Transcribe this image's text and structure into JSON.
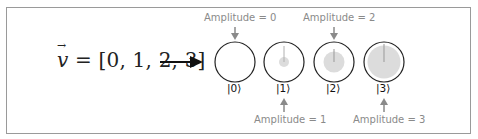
{
  "equation": {
    "lhs": "v",
    "rhs": " = [0, 1, 2, 3]"
  },
  "colors": {
    "arrow": "#111111",
    "label_gray": "#8a8a8a",
    "fill_gray": "#dcdcdc",
    "circle_stroke": "#222222"
  },
  "states": [
    {
      "ket": "|0⟩",
      "amplitude_label": "Amplitude = 0",
      "amplitude": 0,
      "label_position": "top"
    },
    {
      "ket": "|1⟩",
      "amplitude_label": "Amplitude = 1",
      "amplitude": 1,
      "label_position": "bottom"
    },
    {
      "ket": "|2⟩",
      "amplitude_label": "Amplitude = 2",
      "amplitude": 2,
      "label_position": "top"
    },
    {
      "ket": "|3⟩",
      "amplitude_label": "Amplitude = 3",
      "amplitude": 3,
      "label_position": "bottom"
    }
  ]
}
